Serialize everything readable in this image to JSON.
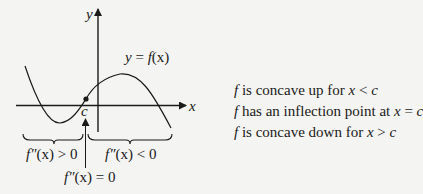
{
  "diagram": {
    "axis_labels": {
      "x": "x",
      "y": "y"
    },
    "curve_label": {
      "lhs": "y",
      "eq": " = ",
      "fn": "f",
      "arg": "(x)"
    },
    "point_label": "c",
    "conditions": {
      "left": {
        "fn": "f″",
        "arg": "(x)",
        "rel": " > 0"
      },
      "right": {
        "fn": "f″",
        "arg": "(x)",
        "rel": " < 0"
      },
      "bottom": {
        "fn": "f″",
        "arg": "(x)",
        "rel": " = 0"
      }
    }
  },
  "notes": [
    {
      "subject": "f",
      "text": " is concave up for ",
      "var": "x",
      "rel": " < ",
      "val": "c"
    },
    {
      "subject": "f",
      "text": " has an inflection point at ",
      "var": "x",
      "rel": " = ",
      "val": "c"
    },
    {
      "subject": "f",
      "text": " is concave down for ",
      "var": "x",
      "rel": " > ",
      "val": "c"
    }
  ],
  "colors": {
    "ink": "#1a1a1a",
    "background": "#f4f4f2"
  }
}
